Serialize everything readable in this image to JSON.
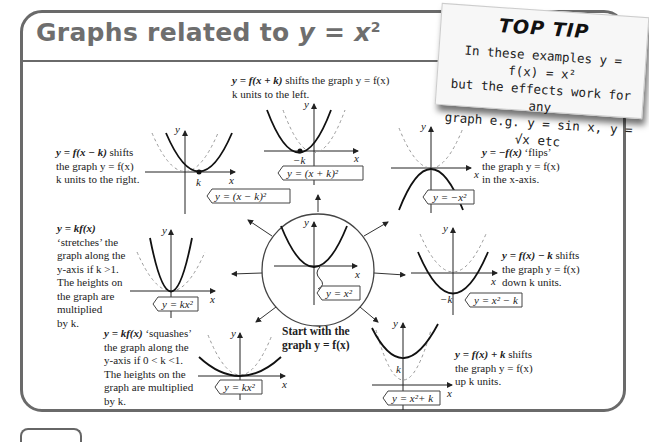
{
  "page": {
    "title_prefix": "Graphs related to ",
    "title_eq": "y = x",
    "title_sup": "2"
  },
  "top_tip": {
    "heading": "TOP TIP",
    "lines": [
      "In these examples y = f(x) = x²",
      "but the effects work for any",
      "graph e.g.  y = sin x, y = √x  etc"
    ]
  },
  "center": {
    "label": "y = x²",
    "caption_line1": "Start with the",
    "caption_line2": "graph y = f(x)"
  },
  "transformations": [
    {
      "id": "shift-left",
      "rule": "y = f(x + k)",
      "desc_lines": [
        " shifts the graph y = f(x)",
        "k units to the left."
      ],
      "graph_label": "y = (x + k)²",
      "marker": "−k"
    },
    {
      "id": "shift-right",
      "rule": "y = f(x − k)",
      "desc_lines": [
        " shifts",
        "the graph y = f(x)",
        "k units to the right."
      ],
      "graph_label": "y = (x − k)²",
      "marker": "k"
    },
    {
      "id": "flip",
      "rule": "y = −f(x)",
      "desc_lines": [
        " ‘flips’",
        "the graph y =  f(x)",
        "in the x-axis."
      ],
      "graph_label": "y = −x²"
    },
    {
      "id": "stretch",
      "rule": "y = kf(x)",
      "desc_lines": [
        "‘stretches’ the",
        "graph along the",
        "y-axis if k >1.",
        "The heights on",
        "the graph are",
        "multiplied",
        "by k."
      ],
      "graph_label": "y = kx²"
    },
    {
      "id": "squash",
      "rule": "y = kf(x)",
      "desc_lines": [
        " ‘squashes’",
        "the graph along the",
        "y-axis if 0 < k <1.",
        "The heights on the",
        "graph are multiplied",
        "by k."
      ],
      "graph_label": "y = kx²"
    },
    {
      "id": "shift-down",
      "rule": "y = f(x) − k",
      "desc_lines": [
        " shifts",
        "the graph y = f(x)",
        "down k units."
      ],
      "graph_label": "y = x² − k",
      "marker": "−k"
    },
    {
      "id": "shift-up",
      "rule": "y = f(x) + k",
      "desc_lines": [
        " shifts",
        "the graph y = f(x)",
        "up k units."
      ],
      "graph_label": "y = x²+ k",
      "marker": "k"
    }
  ],
  "axes": {
    "x": "x",
    "y": "y"
  }
}
